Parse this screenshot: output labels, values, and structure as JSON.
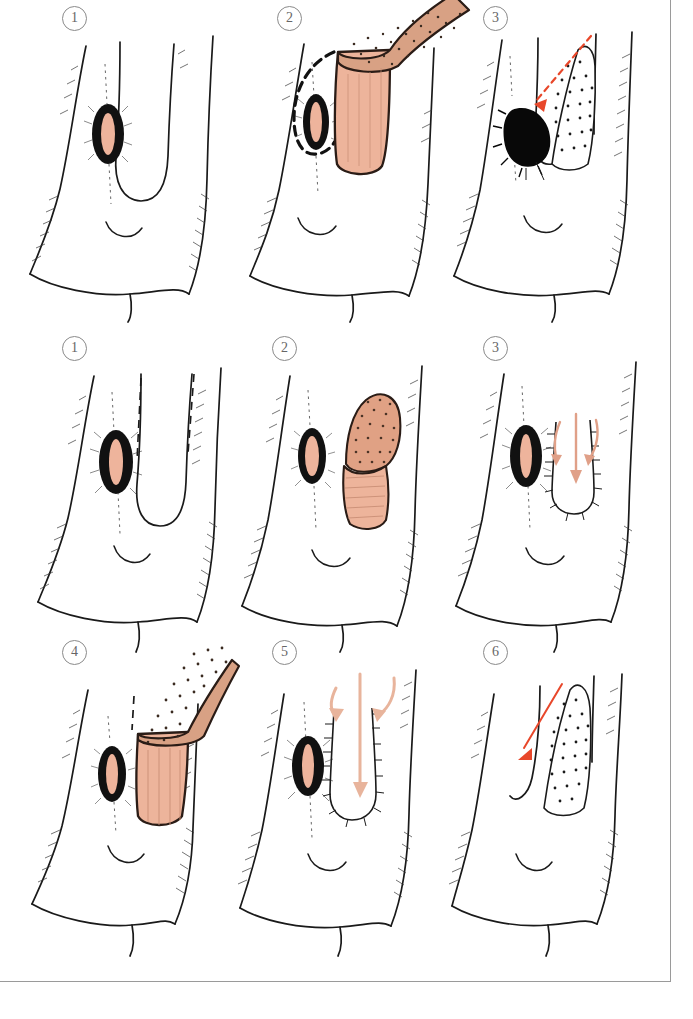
{
  "figure": {
    "background_color": "#ffffff",
    "frame_color": "#9a9a9a",
    "ink_color": "#1a1a1a",
    "flap_fill": "#edb49b",
    "flap_shade": "#e0a184",
    "lesion_fill": "#eeb49c",
    "lesion_rim": "#111111",
    "arrow_red": "#e8472a",
    "arrow_salmon": "#e0a088"
  },
  "rows": [
    {
      "row_id": "row-1",
      "technique": "two-stage-flap",
      "panels": [
        {
          "number": "1",
          "caption": "",
          "features": [
            "midline-lesion",
            "dark-rimmed-lesion",
            "stipple-hatching"
          ]
        },
        {
          "number": "2",
          "caption": "",
          "features": [
            "dashed-incision-outline",
            "raised-pedicled-flap",
            "flap-underside-pink"
          ]
        },
        {
          "number": "3",
          "caption": "",
          "features": [
            "red-dashed-arrow",
            "filled-black-defect",
            "stippled-donor-area"
          ]
        }
      ]
    },
    {
      "row_id": "row-2",
      "technique": "advancement-flap",
      "panels": [
        {
          "number": "1",
          "caption": "",
          "features": [
            "midline-lesion",
            "dashed-planning-lines"
          ]
        },
        {
          "number": "2",
          "caption": "",
          "features": [
            "midline-lesion",
            "folded-flap-island",
            "flap-underside-pink"
          ]
        },
        {
          "number": "3",
          "caption": "",
          "features": [
            "midline-lesion",
            "salmon-advancement-arrows",
            "sutured-edge-hatching"
          ]
        }
      ]
    },
    {
      "row_id": "row-3",
      "technique": "advancement-flap-continued",
      "panels": [
        {
          "number": "4",
          "caption": "",
          "features": [
            "midline-lesion",
            "large-raised-flap",
            "dashed-planning-line"
          ]
        },
        {
          "number": "5",
          "caption": "",
          "features": [
            "midline-lesion",
            "three-salmon-arrows",
            "sutured-edge-hatching"
          ]
        },
        {
          "number": "6",
          "caption": "",
          "features": [
            "red-solid-arrow",
            "stippled-donor-area",
            "closed-defect"
          ]
        }
      ]
    }
  ]
}
